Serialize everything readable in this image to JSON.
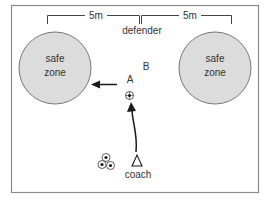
{
  "diagram": {
    "title": "",
    "colors": {
      "border": "#8a8a8a",
      "zone_fill": "#dcdcdc",
      "zone_stroke": "#777777",
      "ink": "#1a1a1a",
      "text": "#333333",
      "background": "#ffffff"
    },
    "measurements": {
      "left_distance": "5m",
      "right_distance": "5m"
    },
    "zones": [
      {
        "id": "left",
        "line1": "safe",
        "line2": "zone"
      },
      {
        "id": "right",
        "line1": "safe",
        "line2": "zone"
      }
    ],
    "players": {
      "defender": "defender",
      "attacker_a": "A",
      "attacker_b": "B",
      "coach": "coach"
    },
    "symbols": {
      "coach_marker": "triangle-icon",
      "ball": "soccer-ball-icon",
      "ball_pile_count": 3
    }
  }
}
